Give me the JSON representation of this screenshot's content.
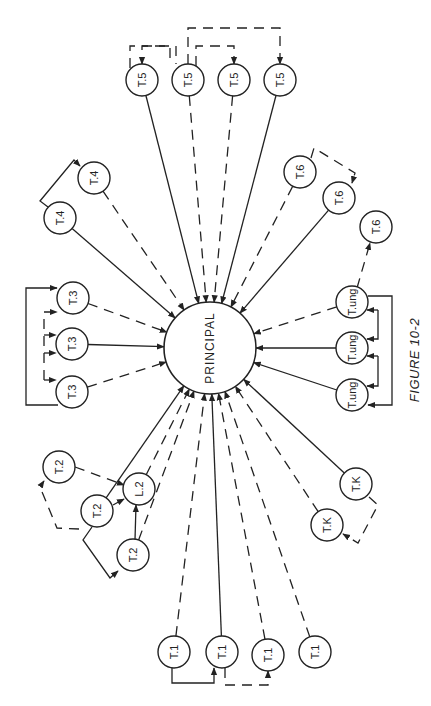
{
  "figure": {
    "caption": "FIGURE 10-2",
    "orientation": "rotated 90 degrees counter-clockwise"
  },
  "principal": {
    "label": "PRINCIPAL",
    "x": 210,
    "y": 348,
    "r": 46
  },
  "node_radius": 16,
  "nodes": [
    {
      "id": "t5a",
      "label": "T.5",
      "group": "T.5",
      "x": 142,
      "y": 80
    },
    {
      "id": "t5b",
      "label": "T.5",
      "group": "T.5",
      "x": 188,
      "y": 80
    },
    {
      "id": "t5c",
      "label": "T.5",
      "group": "T.5",
      "x": 234,
      "y": 80
    },
    {
      "id": "t5d",
      "label": "T.5",
      "group": "T.5",
      "x": 280,
      "y": 80
    },
    {
      "id": "t4a",
      "label": "T.4",
      "group": "T.4",
      "x": 94,
      "y": 178
    },
    {
      "id": "t4b",
      "label": "T.4",
      "group": "T.4",
      "x": 60,
      "y": 218
    },
    {
      "id": "t3a",
      "label": "T.3",
      "group": "T.3",
      "x": 73,
      "y": 298
    },
    {
      "id": "t3b",
      "label": "T.3",
      "group": "T.3",
      "x": 72,
      "y": 344
    },
    {
      "id": "t3c",
      "label": "T.3",
      "group": "T.3",
      "x": 72,
      "y": 392
    },
    {
      "id": "t2a",
      "label": "T.2",
      "group": "T.2",
      "x": 59,
      "y": 467
    },
    {
      "id": "t2b",
      "label": "T.2",
      "group": "T.2",
      "x": 97,
      "y": 511
    },
    {
      "id": "t2c",
      "label": "T.2",
      "group": "T.2",
      "x": 133,
      "y": 555
    },
    {
      "id": "l2",
      "label": "L.2",
      "group": "L.2",
      "x": 139,
      "y": 489
    },
    {
      "id": "t1a",
      "label": "T.1",
      "group": "T.1",
      "x": 174,
      "y": 652
    },
    {
      "id": "t1b",
      "label": "T.1",
      "group": "T.1",
      "x": 222,
      "y": 652
    },
    {
      "id": "t1c",
      "label": "T.1",
      "group": "T.1",
      "x": 268,
      "y": 655
    },
    {
      "id": "t1d",
      "label": "T.1",
      "group": "T.1",
      "x": 315,
      "y": 652
    },
    {
      "id": "tka",
      "label": "T.K",
      "group": "T.K",
      "x": 356,
      "y": 484
    },
    {
      "id": "tkb",
      "label": "T.K",
      "group": "T.K",
      "x": 327,
      "y": 525
    },
    {
      "id": "tua",
      "label": "T.ung",
      "group": "T.ung",
      "x": 352,
      "y": 302
    },
    {
      "id": "tub",
      "label": "T.ung",
      "group": "T.ung",
      "x": 352,
      "y": 348
    },
    {
      "id": "tuc",
      "label": "T.ung",
      "group": "T.ung",
      "x": 352,
      "y": 395
    },
    {
      "id": "t6a",
      "label": "T.6",
      "group": "T.6",
      "x": 300,
      "y": 172
    },
    {
      "id": "t6b",
      "label": "T.6",
      "group": "T.6",
      "x": 339,
      "y": 198
    },
    {
      "id": "t6c",
      "label": "T.6",
      "group": "T.6",
      "x": 376,
      "y": 227
    }
  ],
  "edges_to_principal": [
    {
      "from": "t5a",
      "style": "solid"
    },
    {
      "from": "t5b",
      "style": "dashed"
    },
    {
      "from": "t5c",
      "style": "dashed"
    },
    {
      "from": "t5d",
      "style": "solid"
    },
    {
      "from": "t4a",
      "style": "dashed"
    },
    {
      "from": "t4b",
      "style": "solid"
    },
    {
      "from": "t3a",
      "style": "dashed"
    },
    {
      "from": "t3b",
      "style": "solid"
    },
    {
      "from": "t3c",
      "style": "dashed"
    },
    {
      "from": "t2b",
      "style": "solid"
    },
    {
      "from": "l2",
      "style": "dashed"
    },
    {
      "from": "t2c",
      "style": "dashed"
    },
    {
      "from": "t1a",
      "style": "dashed"
    },
    {
      "from": "t1b",
      "style": "solid"
    },
    {
      "from": "t1c",
      "style": "dashed"
    },
    {
      "from": "t1d",
      "style": "dashed"
    },
    {
      "from": "tkb",
      "style": "dashed"
    },
    {
      "from": "tka",
      "style": "solid"
    },
    {
      "from": "tuc",
      "style": "solid"
    },
    {
      "from": "tub",
      "style": "solid"
    },
    {
      "from": "tua",
      "style": "dashed"
    },
    {
      "from": "t6b",
      "style": "solid"
    },
    {
      "from": "t6a",
      "style": "dashed"
    }
  ],
  "peer_links": [
    {
      "path": "M130,68 L130,46 L176,46 L176,64",
      "style": "dashed",
      "arrow_end": false,
      "from": "t5a",
      "to": "t5b"
    },
    {
      "path": "M130,46 L130,46",
      "style": "solid",
      "arrow_end": false
    },
    {
      "path": "M188,64 L188,28 L280,28 L280,64",
      "style": "dashed",
      "arrow_end": true,
      "from": "t5b",
      "to": "t5d"
    },
    {
      "path": "M196,66 L196,46 L234,46 L234,64",
      "style": "dashed",
      "arrow_end": true,
      "from": "t5b",
      "to": "t5c"
    },
    {
      "path": "M170,58 L170,46 L142,46 L142,64",
      "style": "dashed",
      "arrow_end": true,
      "from": "t5b",
      "to": "t5a"
    },
    {
      "path": "M48,207 L40,201 L74,160 L80,166",
      "style": "solid",
      "arrow_end": true,
      "from": "t4b",
      "to": "t4a"
    },
    {
      "path": "M58,405 L26,405 L26,288 L57,288",
      "style": "solid",
      "arrow_end": true,
      "from": "t3c",
      "to": "t3a"
    },
    {
      "path": "M44,380 L44,312 L57,312",
      "style": "dashed",
      "arrow_end": true,
      "from": "t3c",
      "to": "t3a"
    },
    {
      "path": "M44,335 L56,335",
      "style": "dashed",
      "arrow_end": true
    },
    {
      "path": "M44,353 L56,353",
      "style": "dashed",
      "arrow_end": true
    },
    {
      "path": "M44,380 L56,380",
      "style": "dashed",
      "arrow_end": true
    },
    {
      "path": "M75,467 L124,485",
      "style": "dashed",
      "arrow_end": true,
      "from": "t2a",
      "to": "l2"
    },
    {
      "path": "M113,505 L124,499",
      "style": "solid",
      "arrow_end": true,
      "from": "t2b",
      "to": "l2"
    },
    {
      "path": "M135,540 L136,505",
      "style": "solid",
      "arrow_end": true,
      "from": "t2c",
      "to": "l2"
    },
    {
      "path": "M79,529 L57,528 L40,487 L44,481",
      "style": "dashed",
      "arrow_end": true,
      "from": "t2b",
      "to": "t2a"
    },
    {
      "path": "M92,527 L83,540 L110,578 L118,571",
      "style": "solid",
      "arrow_end": true,
      "from": "t2b",
      "to": "t2c"
    },
    {
      "path": "M172,668 L172,683 L214,683 L214,668",
      "style": "solid",
      "arrow_end": true,
      "from": "t1a",
      "to": "t1b"
    },
    {
      "path": "M225,668 L225,685 L268,685 L268,671",
      "style": "dashed",
      "arrow_end": true,
      "from": "t1b",
      "to": "t1c"
    },
    {
      "path": "M369,497 L378,505 L358,543 L343,534",
      "style": "dashed",
      "arrow_end": true,
      "from": "tka",
      "to": "tkb"
    },
    {
      "path": "M368,296 L392,296 L392,405 L368,405",
      "style": "solid",
      "arrow_end": true,
      "from": "tua",
      "to": "tuc"
    },
    {
      "path": "M378,310 L378,339 L367,339",
      "style": "solid",
      "arrow_end": true
    },
    {
      "path": "M378,310 L367,310",
      "style": "solid",
      "arrow_end": true
    },
    {
      "path": "M378,356 L378,386 L367,386",
      "style": "solid",
      "arrow_end": true
    },
    {
      "path": "M378,356 L367,356",
      "style": "solid",
      "arrow_end": true
    },
    {
      "path": "M311,158 L314,148 L355,173 L352,183",
      "style": "dashed",
      "arrow_end": true,
      "from": "t6a",
      "to": "t6b"
    },
    {
      "path": "M357,288 L370,243",
      "style": "dashed",
      "arrow_end": true,
      "from": "tua",
      "to": "t6c"
    }
  ],
  "colors": {
    "line": "#222222",
    "background": "#ffffff"
  }
}
